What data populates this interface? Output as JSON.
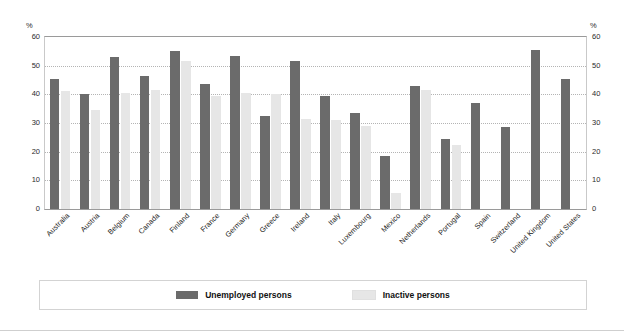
{
  "figure": {
    "cut_title_fragment": "",
    "background_color": "#ffffff"
  },
  "axis": {
    "unit_label_left": "%",
    "unit_label_right": "%",
    "ticks": [
      0,
      10,
      20,
      30,
      40,
      50,
      60
    ]
  },
  "legend": {
    "items": [
      {
        "label": "Unemployed persons",
        "color": "#6b6b6b"
      },
      {
        "label": "Inactive persons",
        "color": "#e6e6e6"
      }
    ]
  },
  "chart_data": {
    "type": "bar",
    "title": "",
    "subtitle": "",
    "xlabel": "",
    "ylabel": "%",
    "ylim": [
      0,
      60
    ],
    "yticks": [
      0,
      10,
      20,
      30,
      40,
      50,
      60
    ],
    "grid": true,
    "legend_position": "bottom",
    "categories": [
      "Australia",
      "Austria",
      "Belgium",
      "Canada",
      "Finland",
      "France",
      "Germany",
      "Greece",
      "Ireland",
      "Italy",
      "Luxembourg",
      "Mexico",
      "Netherlands",
      "Portugal",
      "Spain",
      "Switzerland",
      "United Kingdom",
      "United States"
    ],
    "series": [
      {
        "name": "Unemployed persons",
        "color": "#6b6b6b",
        "values": [
          45.5,
          40.0,
          53.0,
          46.5,
          55.0,
          43.5,
          53.5,
          32.5,
          51.5,
          39.5,
          33.5,
          18.5,
          43.0,
          24.5,
          37.0,
          28.5,
          55.5,
          45.5
        ]
      },
      {
        "name": "Inactive persons",
        "color": "#e6e6e6",
        "values": [
          41.0,
          34.5,
          40.5,
          41.5,
          51.5,
          39.5,
          40.5,
          40.0,
          31.5,
          31.0,
          29.0,
          5.5,
          41.5,
          22.5,
          0,
          0,
          0,
          0
        ]
      }
    ]
  }
}
